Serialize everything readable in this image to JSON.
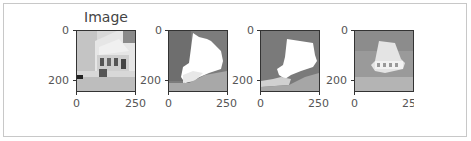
{
  "figure": {
    "title": "Image",
    "panels": [
      {
        "id": "original",
        "kind": "photo-grayscale",
        "yticks": [
          "0",
          "200"
        ],
        "xticks": [
          "0",
          "250"
        ]
      },
      {
        "id": "mask-1",
        "kind": "segmentation-mask",
        "yticks": [
          "0",
          "200"
        ],
        "xticks": [
          "0",
          "250"
        ]
      },
      {
        "id": "mask-2",
        "kind": "segmentation-mask",
        "yticks": [
          "0",
          "200"
        ],
        "xticks": [
          "0",
          "250"
        ]
      },
      {
        "id": "overlay",
        "kind": "photo-overlay",
        "yticks": [
          "0",
          "200"
        ],
        "xticks": [
          "0",
          "25("
        ]
      }
    ]
  },
  "colors": {
    "frame_border": "#c8c8c8",
    "axis": "#333333",
    "tick_text": "#555555"
  }
}
